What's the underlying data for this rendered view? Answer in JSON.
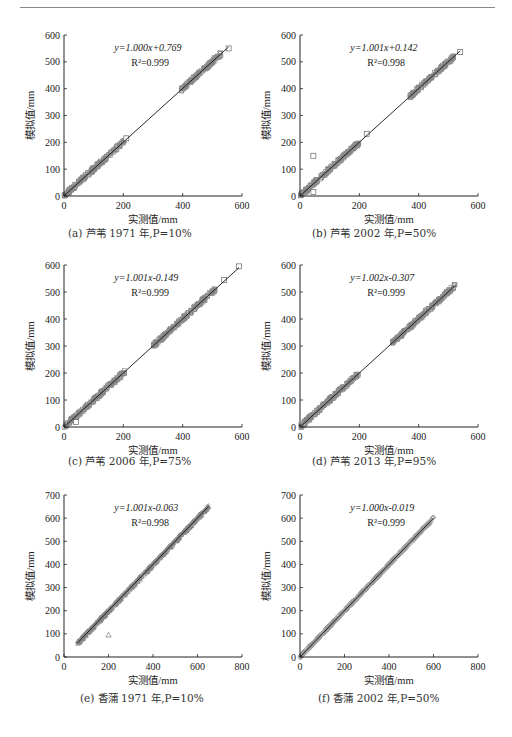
{
  "chart_data": [
    {
      "id": "a",
      "type": "scatter",
      "caption": "(a) 芦苇 1971 年,P=10%",
      "equation": "y=1.000x+0.769",
      "r2": "R²=0.999",
      "xlabel": "实测值/mm",
      "ylabel": "模拟值/mm",
      "xlim": [
        0,
        600
      ],
      "ylim": [
        0,
        600
      ],
      "xticks": [
        0,
        200,
        400,
        600
      ],
      "yticks": [
        0,
        100,
        200,
        300,
        400,
        500,
        600
      ],
      "marker": "square",
      "fit": {
        "slope": 1.0,
        "intercept": 0.769,
        "x_range": [
          0,
          555
        ]
      },
      "clusters": [
        [
          0,
          210
        ],
        [
          395,
          530
        ]
      ],
      "outliers": [
        [
          210,
          215
        ],
        [
          555,
          550
        ]
      ]
    },
    {
      "id": "b",
      "type": "scatter",
      "caption": "(b) 芦苇 2002 年,P=50%",
      "equation": "y=1.001x+0.142",
      "r2": "R²=0.998",
      "xlabel": "实测值/mm",
      "ylabel": "模拟值/mm",
      "xlim": [
        0,
        600
      ],
      "ylim": [
        0,
        600
      ],
      "xticks": [
        0,
        200,
        400,
        600
      ],
      "yticks": [
        0,
        100,
        200,
        300,
        400,
        500,
        600
      ],
      "marker": "square",
      "fit": {
        "slope": 1.001,
        "intercept": 0.142,
        "x_range": [
          0,
          540
        ]
      },
      "clusters": [
        [
          0,
          200
        ],
        [
          370,
          520
        ]
      ],
      "outliers": [
        [
          45,
          150
        ],
        [
          45,
          15
        ],
        [
          225,
          232
        ],
        [
          540,
          537
        ]
      ]
    },
    {
      "id": "c",
      "type": "scatter",
      "caption": "(c) 芦苇 2006 年,P=75%",
      "equation": "y=1.001x-0.149",
      "r2": "R²=0.999",
      "xlabel": "实测值/mm",
      "ylabel": "模拟值/mm",
      "xlim": [
        0,
        600
      ],
      "ylim": [
        0,
        600
      ],
      "xticks": [
        0,
        200,
        400,
        600
      ],
      "yticks": [
        0,
        100,
        200,
        300,
        400,
        500,
        600
      ],
      "marker": "square",
      "fit": {
        "slope": 1.001,
        "intercept": -0.149,
        "x_range": [
          0,
          590
        ]
      },
      "clusters": [
        [
          0,
          205
        ],
        [
          300,
          510
        ]
      ],
      "outliers": [
        [
          40,
          18
        ],
        [
          540,
          545
        ],
        [
          590,
          595
        ]
      ]
    },
    {
      "id": "d",
      "type": "scatter",
      "caption": "(d) 芦苇 2013 年,P=95%",
      "equation": "y=1.002x-0.307",
      "r2": "R²=0.999",
      "xlabel": "实测值/mm",
      "ylabel": "模拟值/mm",
      "xlim": [
        0,
        600
      ],
      "ylim": [
        0,
        600
      ],
      "xticks": [
        0,
        200,
        400,
        600
      ],
      "yticks": [
        0,
        100,
        200,
        300,
        400,
        500,
        600
      ],
      "marker": "square",
      "fit": {
        "slope": 1.002,
        "intercept": -0.307,
        "x_range": [
          0,
          525
        ]
      },
      "clusters": [
        [
          0,
          200
        ],
        [
          310,
          525
        ]
      ],
      "outliers": []
    },
    {
      "id": "e",
      "type": "scatter",
      "caption": "(e) 香蒲 1971 年,P=10%",
      "equation": "y=1.001x-0.063",
      "r2": "R²=0.998",
      "xlabel": "实测值/mm",
      "ylabel": "模拟值/mm",
      "xlim": [
        0,
        800
      ],
      "ylim": [
        0,
        700
      ],
      "xticks": [
        0,
        200,
        400,
        600,
        800
      ],
      "yticks": [
        0,
        100,
        200,
        300,
        400,
        500,
        600,
        700
      ],
      "marker": "triangle",
      "fit": {
        "slope": 1.001,
        "intercept": -0.063,
        "x_range": [
          60,
          650
        ]
      },
      "clusters": [
        [
          60,
          650
        ]
      ],
      "outliers": [
        [
          200,
          95
        ]
      ]
    },
    {
      "id": "f",
      "type": "scatter",
      "caption": "(f) 香蒲 2002 年,P=50%",
      "equation": "y=1.000x-0.019",
      "r2": "R²=0.999",
      "xlabel": "实测值/mm",
      "ylabel": "模拟值/mm",
      "xlim": [
        0,
        800
      ],
      "ylim": [
        0,
        700
      ],
      "xticks": [
        0,
        200,
        400,
        600,
        800
      ],
      "yticks": [
        0,
        100,
        200,
        300,
        400,
        500,
        600,
        700
      ],
      "marker": "diamond",
      "fit": {
        "slope": 1.0,
        "intercept": -0.019,
        "x_range": [
          0,
          600
        ]
      },
      "clusters": [
        [
          0,
          600
        ]
      ],
      "outliers": []
    }
  ],
  "layout": [
    {
      "left": 64,
      "top": 35,
      "w": 178,
      "h": 161,
      "cap_x": 68,
      "cap_y": 225
    },
    {
      "left": 300,
      "top": 35,
      "w": 178,
      "h": 161,
      "cap_x": 312,
      "cap_y": 225
    },
    {
      "left": 64,
      "top": 265,
      "w": 178,
      "h": 162,
      "cap_x": 68,
      "cap_y": 453
    },
    {
      "left": 300,
      "top": 265,
      "w": 178,
      "h": 162,
      "cap_x": 312,
      "cap_y": 453
    },
    {
      "left": 64,
      "top": 495,
      "w": 178,
      "h": 162,
      "cap_x": 80,
      "cap_y": 690
    },
    {
      "left": 300,
      "top": 495,
      "w": 178,
      "h": 162,
      "cap_x": 318,
      "cap_y": 690
    }
  ]
}
